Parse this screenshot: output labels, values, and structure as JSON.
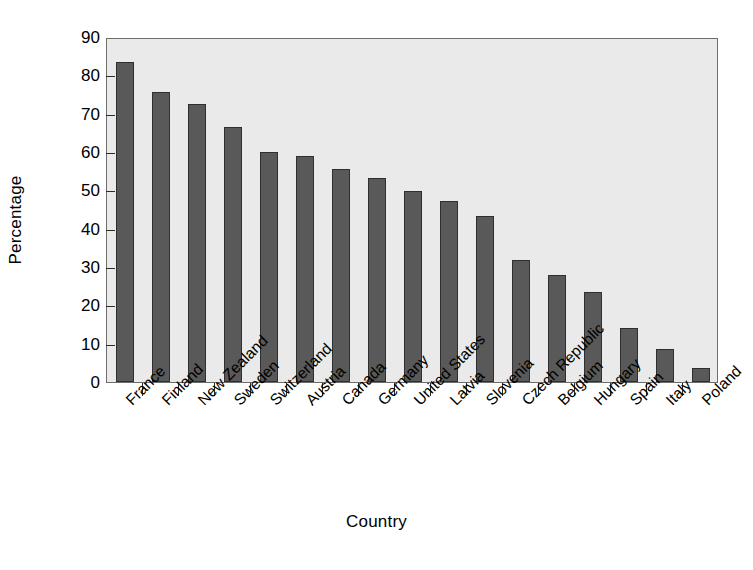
{
  "chart_data": {
    "type": "bar",
    "title": "",
    "xlabel": "Country",
    "ylabel": "Percentage",
    "ylim": [
      0,
      90
    ],
    "ytick_step": 10,
    "yticks": [
      0,
      10,
      20,
      30,
      40,
      50,
      60,
      70,
      80,
      90
    ],
    "ytick_labels": [
      "0",
      "10",
      "20",
      "30",
      "40",
      "50",
      "60",
      "70",
      "80",
      "90"
    ],
    "grid": false,
    "legend": false,
    "legend_position": "none",
    "bar_color": "#595959",
    "bar_edge_color": "#2f2f2f",
    "plot_background": "#eaeaea",
    "frame_color": "#6d6d6d",
    "categories": [
      "France",
      "Finland",
      "New Zealand",
      "Sweden",
      "Switzerland",
      "Austria",
      "Canada",
      "Germany",
      "United States",
      "Latvia",
      "Slovenia",
      "Czech Republic",
      "Belgium",
      "Hungary",
      "Spain",
      "Italy",
      "Poland"
    ],
    "values": [
      83.5,
      75.6,
      72.6,
      66.5,
      60.0,
      59.0,
      55.5,
      53.3,
      49.8,
      47.2,
      43.4,
      31.8,
      28.0,
      23.5,
      14.2,
      8.7,
      3.6
    ]
  }
}
